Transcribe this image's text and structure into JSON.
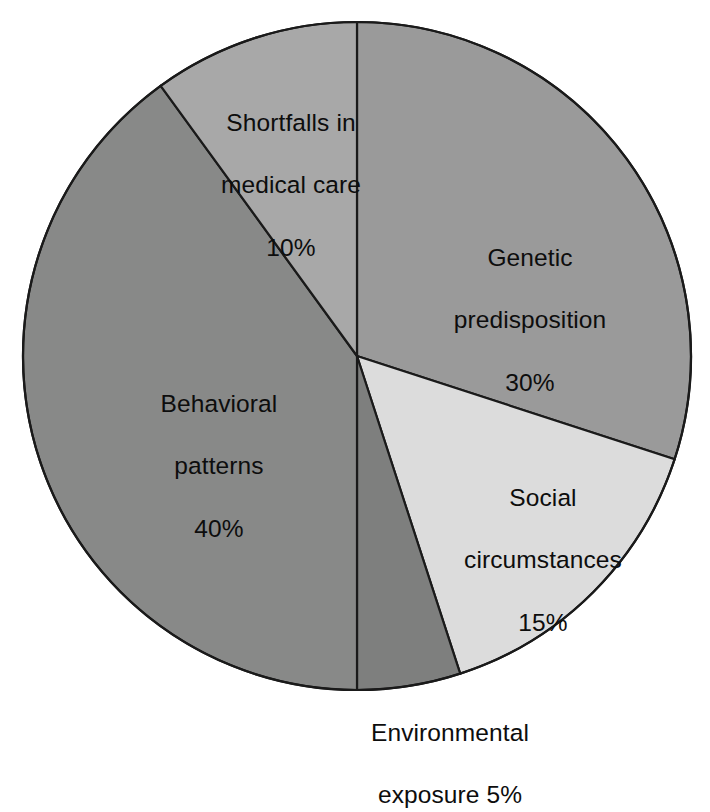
{
  "chart_data": {
    "type": "pie",
    "title": "",
    "subtitle": "",
    "xlabel": "",
    "ylabel": "",
    "units": "percent",
    "total": 100,
    "legend_position": "none",
    "grid": false,
    "start_angle_deg": 0,
    "direction": "clockwise",
    "categories": [
      "Genetic predisposition",
      "Social circumstances",
      "Environmental exposure",
      "Behavioral patterns",
      "Shortfalls in medical care"
    ],
    "values": [
      30,
      15,
      5,
      40,
      10
    ],
    "slices": [
      {
        "name": "Genetic predisposition",
        "label_line1": "Genetic",
        "label_line2": "predisposition",
        "value": 30,
        "value_label": "30%",
        "color": "#9a9a9a",
        "start_deg": 0,
        "end_deg": 108,
        "label_placement": "inside"
      },
      {
        "name": "Social circumstances",
        "label_line1": "Social",
        "label_line2": "circumstances",
        "value": 15,
        "value_label": "15%",
        "color": "#dcdcdc",
        "start_deg": 108,
        "end_deg": 162,
        "label_placement": "inside"
      },
      {
        "name": "Environmental exposure",
        "label_line1": "Environmental",
        "label_line2": "exposure 5%",
        "value": 5,
        "value_label": "5%",
        "color": "#7e7f7e",
        "start_deg": 162,
        "end_deg": 180,
        "label_placement": "outside-bottom"
      },
      {
        "name": "Behavioral patterns",
        "label_line1": "Behavioral",
        "label_line2": "patterns",
        "value": 40,
        "value_label": "40%",
        "color": "#888988",
        "start_deg": 180,
        "end_deg": 324,
        "label_placement": "inside"
      },
      {
        "name": "Shortfalls in medical care",
        "label_line1": "Shortfalls in",
        "label_line2": "medical care",
        "value": 10,
        "value_label": "10%",
        "color": "#a8a8a8",
        "start_deg": 324,
        "end_deg": 360,
        "label_placement": "inside"
      }
    ],
    "geometry": {
      "center_x": 357,
      "center_y": 356,
      "radius": 334
    },
    "style": {
      "background": "#ffffff",
      "stroke": "#1a1a1a",
      "text_color": "#0d0d0d"
    }
  }
}
